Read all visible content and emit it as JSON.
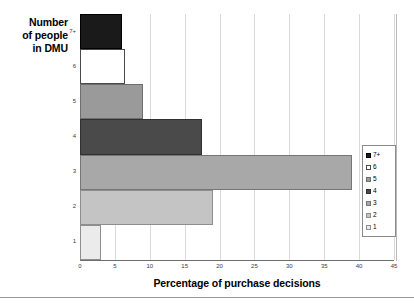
{
  "chart_data": {
    "type": "bar",
    "orientation": "horizontal",
    "title": "",
    "xlabel": "Percentage of purchase decisions",
    "ylabel": "Number of people in DMU",
    "categories": [
      "7+",
      "6",
      "5",
      "4",
      "3",
      "2",
      "1"
    ],
    "values": [
      6,
      6.5,
      9,
      17.5,
      39,
      19,
      3
    ],
    "xlim": [
      0,
      45
    ],
    "xticks": [
      0,
      5,
      10,
      15,
      20,
      25,
      30,
      35,
      40,
      45
    ],
    "xtick_labels": [
      "0",
      "5",
      "10",
      "15",
      "20",
      "25",
      "30",
      "35",
      "40",
      "45"
    ],
    "grid": true,
    "grid_axis": "x",
    "legend_position": "right",
    "legend_entries": [
      "7+",
      "6",
      "5",
      "4",
      "3",
      "2",
      "1"
    ],
    "series": [
      {
        "name": "7+",
        "value": 6,
        "color": "#1a1a1a",
        "border": "#000000"
      },
      {
        "name": "6",
        "value": 6.5,
        "color": "#ffffff",
        "border": "#4a4a4a"
      },
      {
        "name": "5",
        "value": 9,
        "color": "#9a9a9a",
        "border": "#6e6e6e"
      },
      {
        "name": "4",
        "value": 17.5,
        "color": "#4a4a4a",
        "border": "#303030"
      },
      {
        "name": "3",
        "value": 39,
        "color": "#a8a8a8",
        "border": "#767676"
      },
      {
        "name": "2",
        "value": 19,
        "color": "#c4c4c4",
        "border": "#8e8e8e"
      },
      {
        "name": "1",
        "value": 3,
        "color": "#ebebeb",
        "border": "#8e8e8e"
      }
    ]
  },
  "axes": {
    "y_title_lines": [
      "Number",
      "of people",
      "in DMU"
    ],
    "x_title": "Percentage of purchase decisions"
  },
  "legend": {
    "items": [
      {
        "label": "7+"
      },
      {
        "label": "6"
      },
      {
        "label": "5"
      },
      {
        "label": "4"
      },
      {
        "label": "3"
      },
      {
        "label": "2"
      },
      {
        "label": "1"
      }
    ]
  },
  "colors": {
    "axis": "#6e6e6e",
    "grid": "#d9d9d9",
    "text": "#000000",
    "tick_text": "#3a3a3a"
  }
}
